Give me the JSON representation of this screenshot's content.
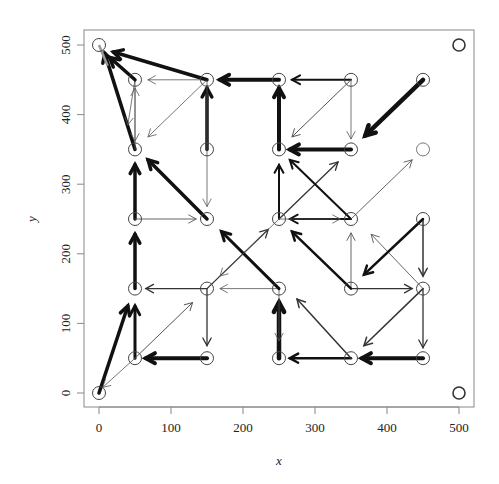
{
  "chart_data": {
    "type": "scatter",
    "subtype": "vector-field / arrow plot on a grid of states",
    "title": "",
    "xlabel": "x",
    "ylabel": "y",
    "xlim": [
      0,
      500
    ],
    "ylim": [
      0,
      500
    ],
    "xticks": [
      0,
      100,
      200,
      300,
      400,
      500
    ],
    "yticks": [
      0,
      100,
      200,
      300,
      400,
      500
    ],
    "grid": false,
    "legend": null,
    "colors": {
      "arrow": "#111111",
      "thin_arrow": "#555555",
      "point": "#444444",
      "axis": "#777777"
    },
    "points": [
      {
        "x": 0,
        "y": 0
      },
      {
        "x": 50,
        "y": 50
      },
      {
        "x": 150,
        "y": 50
      },
      {
        "x": 250,
        "y": 50
      },
      {
        "x": 350,
        "y": 50
      },
      {
        "x": 450,
        "y": 50
      },
      {
        "x": 50,
        "y": 150
      },
      {
        "x": 150,
        "y": 150
      },
      {
        "x": 250,
        "y": 150
      },
      {
        "x": 350,
        "y": 150
      },
      {
        "x": 450,
        "y": 150
      },
      {
        "x": 50,
        "y": 250
      },
      {
        "x": 150,
        "y": 250
      },
      {
        "x": 250,
        "y": 250
      },
      {
        "x": 350,
        "y": 250
      },
      {
        "x": 450,
        "y": 250
      },
      {
        "x": 50,
        "y": 350
      },
      {
        "x": 150,
        "y": 350
      },
      {
        "x": 250,
        "y": 350
      },
      {
        "x": 350,
        "y": 350
      },
      {
        "x": 450,
        "y": 350
      },
      {
        "x": 50,
        "y": 450
      },
      {
        "x": 150,
        "y": 450
      },
      {
        "x": 250,
        "y": 450
      },
      {
        "x": 350,
        "y": 450
      },
      {
        "x": 450,
        "y": 450
      },
      {
        "x": 0,
        "y": 500
      },
      {
        "x": 500,
        "y": 500
      },
      {
        "x": 500,
        "y": 0
      }
    ],
    "arrows": [
      {
        "x0": 0,
        "y0": 0,
        "x1": 40,
        "y1": 125,
        "w": 3.5
      },
      {
        "x0": 50,
        "y0": 50,
        "x1": 50,
        "y1": 125,
        "w": 3
      },
      {
        "x0": 50,
        "y0": 50,
        "x1": 130,
        "y1": 130,
        "w": 1
      },
      {
        "x0": 50,
        "y0": 50,
        "x1": 5,
        "y1": 8,
        "w": 0.8
      },
      {
        "x0": 150,
        "y0": 50,
        "x1": 65,
        "y1": 50,
        "w": 4
      },
      {
        "x0": 250,
        "y0": 50,
        "x1": 250,
        "y1": 130,
        "w": 4.5
      },
      {
        "x0": 250,
        "y0": 150,
        "x1": 250,
        "y1": 75,
        "w": 0.8
      },
      {
        "x0": 350,
        "y0": 50,
        "x1": 265,
        "y1": 50,
        "w": 2.5
      },
      {
        "x0": 350,
        "y0": 50,
        "x1": 275,
        "y1": 135,
        "w": 1.5
      },
      {
        "x0": 450,
        "y0": 50,
        "x1": 365,
        "y1": 50,
        "w": 4
      },
      {
        "x0": 450,
        "y0": 150,
        "x1": 450,
        "y1": 65,
        "w": 1.3
      },
      {
        "x0": 450,
        "y0": 150,
        "x1": 368,
        "y1": 68,
        "w": 1.5
      },
      {
        "x0": 50,
        "y0": 150,
        "x1": 50,
        "y1": 228,
        "w": 3.5
      },
      {
        "x0": 150,
        "y0": 150,
        "x1": 65,
        "y1": 150,
        "w": 1.3
      },
      {
        "x0": 150,
        "y0": 150,
        "x1": 150,
        "y1": 68,
        "w": 1.3
      },
      {
        "x0": 150,
        "y0": 150,
        "x1": 235,
        "y1": 235,
        "w": 1.3
      },
      {
        "x0": 250,
        "y0": 150,
        "x1": 168,
        "y1": 150,
        "w": 0.8
      },
      {
        "x0": 250,
        "y0": 150,
        "x1": 170,
        "y1": 232,
        "w": 3
      },
      {
        "x0": 350,
        "y0": 150,
        "x1": 435,
        "y1": 150,
        "w": 1.3
      },
      {
        "x0": 350,
        "y0": 150,
        "x1": 350,
        "y1": 230,
        "w": 0.9
      },
      {
        "x0": 350,
        "y0": 150,
        "x1": 268,
        "y1": 232,
        "w": 2.5
      },
      {
        "x0": 450,
        "y0": 150,
        "x1": 378,
        "y1": 228,
        "w": 0.9
      },
      {
        "x0": 450,
        "y0": 250,
        "x1": 450,
        "y1": 168,
        "w": 1.5
      },
      {
        "x0": 450,
        "y0": 250,
        "x1": 368,
        "y1": 170,
        "w": 2.5
      },
      {
        "x0": 50,
        "y0": 250,
        "x1": 50,
        "y1": 328,
        "w": 3.5
      },
      {
        "x0": 50,
        "y0": 250,
        "x1": 135,
        "y1": 250,
        "w": 0.9
      },
      {
        "x0": 150,
        "y0": 250,
        "x1": 68,
        "y1": 335,
        "w": 3.5
      },
      {
        "x0": 250,
        "y0": 250,
        "x1": 250,
        "y1": 328,
        "w": 2
      },
      {
        "x0": 250,
        "y0": 250,
        "x1": 332,
        "y1": 332,
        "w": 1.3
      },
      {
        "x0": 250,
        "y0": 250,
        "x1": 168,
        "y1": 168,
        "w": 0.8
      },
      {
        "x0": 350,
        "y0": 250,
        "x1": 265,
        "y1": 250,
        "w": 1.8
      },
      {
        "x0": 250,
        "y0": 250,
        "x1": 335,
        "y1": 250,
        "w": 0.8
      },
      {
        "x0": 350,
        "y0": 250,
        "x1": 265,
        "y1": 335,
        "w": 2
      },
      {
        "x0": 350,
        "y0": 250,
        "x1": 435,
        "y1": 335,
        "w": 0.9
      },
      {
        "x0": 50,
        "y0": 350,
        "x1": 8,
        "y1": 488,
        "w": 3.5
      },
      {
        "x0": 50,
        "y0": 450,
        "x1": 40,
        "y1": 385,
        "w": 0.8
      },
      {
        "x0": 50,
        "y0": 450,
        "x1": 50,
        "y1": 362,
        "w": 0.8
      },
      {
        "x0": 50,
        "y0": 350,
        "x1": 50,
        "y1": 438,
        "w": 0.8
      },
      {
        "x0": 50,
        "y0": 450,
        "x1": 15,
        "y1": 482,
        "w": 3.5
      },
      {
        "x0": 150,
        "y0": 350,
        "x1": 150,
        "y1": 438,
        "w": 3.5
      },
      {
        "x0": 150,
        "y0": 450,
        "x1": 150,
        "y1": 268,
        "w": 0.8
      },
      {
        "x0": 150,
        "y0": 450,
        "x1": 68,
        "y1": 450,
        "w": 0.8
      },
      {
        "x0": 150,
        "y0": 450,
        "x1": 20,
        "y1": 490,
        "w": 3.5
      },
      {
        "x0": 150,
        "y0": 450,
        "x1": 68,
        "y1": 368,
        "w": 0.8
      },
      {
        "x0": 250,
        "y0": 450,
        "x1": 168,
        "y1": 450,
        "w": 4
      },
      {
        "x0": 250,
        "y0": 350,
        "x1": 250,
        "y1": 438,
        "w": 4
      },
      {
        "x0": 350,
        "y0": 450,
        "x1": 268,
        "y1": 450,
        "w": 2
      },
      {
        "x0": 350,
        "y0": 450,
        "x1": 268,
        "y1": 368,
        "w": 1
      },
      {
        "x0": 350,
        "y0": 450,
        "x1": 350,
        "y1": 365,
        "w": 0.8
      },
      {
        "x0": 350,
        "y0": 350,
        "x1": 265,
        "y1": 350,
        "w": 4
      },
      {
        "x0": 450,
        "y0": 450,
        "x1": 370,
        "y1": 370,
        "w": 4.5
      }
    ],
    "annotations": []
  },
  "axes": {
    "x_title": "x",
    "y_title": "y",
    "x_tick_labels": [
      "0",
      "100",
      "200",
      "300",
      "400",
      "500"
    ],
    "y_tick_labels": [
      "0",
      "100",
      "200",
      "300",
      "400",
      "500"
    ]
  }
}
